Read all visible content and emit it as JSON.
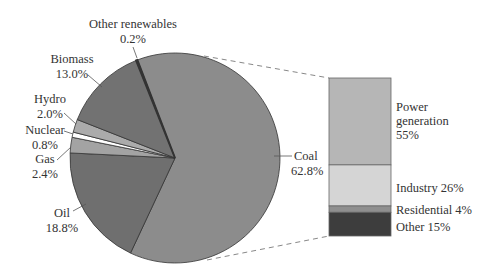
{
  "chart_data": [
    {
      "type": "pie",
      "title": "",
      "categories": [
        "Coal",
        "Oil",
        "Gas",
        "Nuclear",
        "Hydro",
        "Biomass",
        "Other renewables"
      ],
      "values": [
        62.8,
        18.8,
        2.4,
        0.8,
        2.0,
        13.0,
        0.2
      ],
      "unit": "%",
      "labels": [
        {
          "name": "Coal",
          "value": "62.8%"
        },
        {
          "name": "Oil",
          "value": "18.8%"
        },
        {
          "name": "Gas",
          "value": "2.4%"
        },
        {
          "name": "Nuclear",
          "value": "0.8%"
        },
        {
          "name": "Hydro",
          "value": "2.0%"
        },
        {
          "name": "Biomass",
          "value": "13.0%"
        },
        {
          "name": "Other renewables",
          "value": "0.2%"
        }
      ],
      "colors": [
        "#8c8c8c",
        "#6f6f6f",
        "#a3a3a3",
        "#ffffff",
        "#ababab",
        "#727272",
        "#111111"
      ],
      "start_angle_deg": 339,
      "direction": "clockwise",
      "exploded_slice": "Coal"
    },
    {
      "type": "bar",
      "stacked": true,
      "title": "",
      "parent_slice": "Coal",
      "categories": [
        "Power generation",
        "Industry",
        "Residential",
        "Other"
      ],
      "values": [
        55,
        26,
        4,
        15
      ],
      "unit": "%",
      "labels": [
        {
          "line1": "Power",
          "line2": "generation",
          "line3": "55%"
        },
        {
          "text": "Industry 26%"
        },
        {
          "text": "Residential 4%"
        },
        {
          "text": "Other 15%"
        }
      ],
      "colors": [
        "#b6b6b6",
        "#d5d5d5",
        "#8f8f8f",
        "#3d3d3d"
      ]
    }
  ]
}
